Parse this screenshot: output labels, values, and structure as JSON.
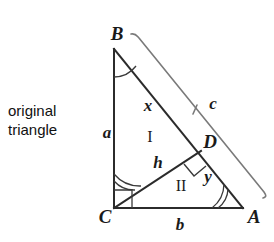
{
  "figure": {
    "caption": {
      "line1": "original",
      "line2": "triangle"
    },
    "vertices": [
      {
        "id": "B",
        "label": "B",
        "x": 114,
        "y": 49,
        "label_x": 117,
        "label_y": 33
      },
      {
        "id": "C",
        "label": "C",
        "x": 114,
        "y": 208,
        "label_x": 105,
        "label_y": 216
      },
      {
        "id": "A",
        "label": "A",
        "x": 243,
        "y": 208,
        "label_x": 254,
        "label_y": 216
      },
      {
        "id": "D",
        "label": "D",
        "x": 201,
        "y": 151,
        "label_x": 210,
        "label_y": 141
      }
    ],
    "side_labels": [
      {
        "name": "a",
        "label": "a",
        "x": 107,
        "y": 132
      },
      {
        "name": "b",
        "label": "b",
        "x": 180,
        "y": 224
      },
      {
        "name": "c",
        "label": "c",
        "x": 213,
        "y": 103
      },
      {
        "name": "x",
        "label": "x",
        "x": 148,
        "y": 105
      },
      {
        "name": "h",
        "label": "h",
        "x": 158,
        "y": 162
      },
      {
        "name": "y",
        "label": "y",
        "x": 208,
        "y": 176
      }
    ],
    "region_labels": [
      {
        "name": "region-one",
        "label": "I",
        "x": 150,
        "y": 137
      },
      {
        "name": "region-two",
        "label": "II",
        "x": 181,
        "y": 186
      }
    ],
    "angle_marks": [
      {
        "name": "angle-b",
        "vertex": "B",
        "arcs": 1
      },
      {
        "name": "angle-a",
        "vertex": "A",
        "arcs": 2
      },
      {
        "name": "angle-c-acb",
        "vertex": "C",
        "arcs": 2
      },
      {
        "name": "right-angle-c",
        "vertex": "C",
        "type": "square"
      },
      {
        "name": "right-angle-d",
        "vertex": "D",
        "type": "square"
      }
    ],
    "colors": {
      "stroke": "#2b2b2b",
      "bracket": "#6f6f6f",
      "text": "#1a1a1a",
      "background": "#ffffff"
    }
  }
}
